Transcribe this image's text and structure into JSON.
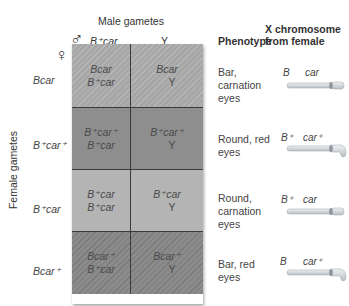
{
  "diagram": {
    "type": "punnett-square",
    "headers": {
      "male_gametes": "Male gametes",
      "male_symbol": "♂",
      "female_symbol": "♀",
      "female_gametes": "Female gametes",
      "phenotype": "Phenotype",
      "x_chromosome_line1": "X chromosome",
      "x_chromosome_line2": "from female"
    },
    "columns": [
      {
        "label": "B⁺car"
      },
      {
        "label": "Y"
      }
    ],
    "rows": [
      {
        "label": "Bcar",
        "cells": [
          [
            "Bcar",
            "B⁺car"
          ],
          [
            "Bcar",
            "Y"
          ]
        ],
        "phenotype": [
          "Bar,",
          "carnation",
          "eyes"
        ],
        "chromosome": {
          "left": "B",
          "right": "car"
        }
      },
      {
        "label": "B⁺car⁺",
        "cells": [
          [
            "B⁺car⁺",
            "B⁺car"
          ],
          [
            "B⁺car⁺",
            "Y"
          ]
        ],
        "phenotype": [
          "Round, red",
          "eyes"
        ],
        "chromosome": {
          "left": "B⁺",
          "right": "car⁺"
        }
      },
      {
        "label": "B⁺car",
        "cells": [
          [
            "B⁺car",
            "B⁺car"
          ],
          [
            "B⁺car",
            "Y"
          ]
        ],
        "phenotype": [
          "Round,",
          "carnation",
          "eyes"
        ],
        "chromosome": {
          "left": "B⁺",
          "right": "car"
        }
      },
      {
        "label": "Bcar⁺",
        "cells": [
          [
            "Bcar⁺",
            "B⁺car"
          ],
          [
            "Bcar⁺",
            "Y"
          ]
        ],
        "phenotype": [
          "Bar, red",
          "eyes"
        ],
        "chromosome": {
          "left": "B",
          "right": "car⁺"
        }
      }
    ],
    "colors": {
      "row1": "#a7a7a7",
      "row2": "#8e8e8e",
      "row3": "#b4b4b4",
      "row4": "#8b8b8b",
      "grid_line": "#3a3a3a",
      "chromosome_fill": "#d9dde0"
    }
  }
}
